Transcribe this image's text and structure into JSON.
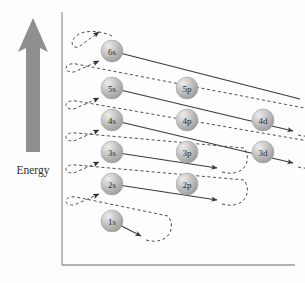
{
  "figure": {
    "background_color": "#fdfdfd"
  },
  "axis": {
    "energy_label": "Energy",
    "axis_color": "#9a9a9a",
    "vertical_axis": {
      "x": 62,
      "y_top": 12,
      "y_bottom": 265
    },
    "horizontal_axis": {
      "y": 265,
      "x_left": 62,
      "x_right": 295
    }
  },
  "energy_arrow": {
    "name": "energy-arrow",
    "color": "#8c8c8c",
    "tip_y": 18,
    "base_y": 152,
    "center_x": 33
  },
  "orbitals": [
    {
      "id": "6s",
      "label": "6s",
      "cx": 112,
      "cy": 51,
      "r": 11
    },
    {
      "id": "5s",
      "label": "5s",
      "cx": 112,
      "cy": 88,
      "r": 11
    },
    {
      "id": "4s",
      "label": "4s",
      "cx": 112,
      "cy": 120,
      "r": 11
    },
    {
      "id": "3s",
      "label": "3s",
      "cx": 112,
      "cy": 152,
      "r": 11
    },
    {
      "id": "2s",
      "label": "2s",
      "cx": 112,
      "cy": 184,
      "r": 11
    },
    {
      "id": "1s",
      "label": "1s",
      "cx": 112,
      "cy": 221,
      "r": 11
    },
    {
      "id": "5p",
      "label": "5p",
      "cx": 187,
      "cy": 88,
      "r": 11
    },
    {
      "id": "4p",
      "label": "4p",
      "cx": 187,
      "cy": 120,
      "r": 11
    },
    {
      "id": "3p",
      "label": "3p",
      "cx": 187,
      "cy": 152,
      "r": 11
    },
    {
      "id": "2p",
      "label": "2p",
      "cx": 187,
      "cy": 184,
      "r": 11
    },
    {
      "id": "4d",
      "label": "4d",
      "cx": 263,
      "cy": 120,
      "r": 11
    },
    {
      "id": "3d",
      "label": "3d",
      "cx": 263,
      "cy": 152,
      "r": 11
    }
  ],
  "sphere_style": {
    "highlight_color": "#e8e8e8",
    "mid_color": "#b9b9b9",
    "edge_color": "#8f8f8f",
    "stroke_color": "#9c9c9c"
  },
  "diagonals": [
    {
      "name": "diagonal-1s",
      "from": "1s",
      "to_x": 141,
      "to_y": 236,
      "arrow": true
    },
    {
      "name": "diagonal-2s-2p",
      "from": "2s",
      "to_x": 216,
      "to_y": 199,
      "arrow": true
    },
    {
      "name": "diagonal-3s-3p",
      "from": "3s",
      "to_x": 216,
      "to_y": 167,
      "arrow": true
    },
    {
      "name": "diagonal-4s-4p-3d",
      "from": "4s",
      "to_x": 292,
      "to_y": 162,
      "arrow": true
    },
    {
      "name": "diagonal-5s-5p-4d",
      "from": "5s",
      "to_x": 292,
      "to_y": 130,
      "arrow": true
    },
    {
      "name": "diagonal-6s",
      "from": "6s",
      "to_x": 292,
      "to_y": 98,
      "arrow": false
    }
  ],
  "return_loops": [
    {
      "name": "return-loop-1s-to-2s",
      "start_x": 148,
      "start_y": 240,
      "end_x": 97,
      "end_y": 194,
      "bulge_x": 176,
      "bulge_y": 224,
      "top_y": 201
    },
    {
      "name": "return-loop-2p-to-3s",
      "start_x": 224,
      "start_y": 203,
      "end_x": 97,
      "end_y": 162,
      "bulge_x": 252,
      "bulge_y": 187,
      "top_y": 169
    },
    {
      "name": "return-loop-3p-to-4s",
      "start_x": 224,
      "start_y": 171,
      "end_x": 97,
      "end_y": 130,
      "bulge_x": 252,
      "bulge_y": 155,
      "top_y": 137
    },
    {
      "name": "return-loop-3d-to-5s",
      "start_x": 300,
      "start_y": 166,
      "end_x": 97,
      "end_y": 98,
      "bulge_x": 328,
      "bulge_y": 150,
      "top_y": 105
    },
    {
      "name": "return-loop-4d-to-6s",
      "start_x": 300,
      "start_y": 134,
      "end_x": 97,
      "end_y": 61,
      "bulge_x": 328,
      "bulge_y": 118,
      "top_y": 68
    },
    {
      "name": "return-loop-top",
      "start_x": 300,
      "start_y": 102,
      "end_x": 97,
      "end_y": 32,
      "bulge_x": 328,
      "bulge_y": 86,
      "top_y": 36
    }
  ],
  "dash_style": {
    "color": "#555555",
    "pattern": "3,2.6",
    "width": 1.0
  },
  "solid_style": {
    "color": "#3a3a3a",
    "width": 1.05
  },
  "filling_order": [
    "1s",
    "2s",
    "2p",
    "3s",
    "3p",
    "4s",
    "3d",
    "4p",
    "5s",
    "4d",
    "5p",
    "6s"
  ]
}
